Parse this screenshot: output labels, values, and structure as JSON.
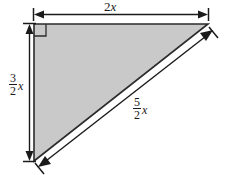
{
  "figure": {
    "type": "geometry-diagram",
    "shape": "right-triangle",
    "background_color": "#ffffff",
    "fill_color": "#c9c9c9",
    "stroke_color": "#2b2b2b",
    "right_angle_marker": {
      "present": true,
      "location": "top-left-vertex"
    },
    "vertices": {
      "top_left": [
        34,
        24
      ],
      "top_right": [
        208,
        24
      ],
      "bottom_left": [
        34,
        161
      ]
    },
    "labels": {
      "top": {
        "name": "top-side-length",
        "coefficient": "2",
        "variable": "x",
        "text": "2x"
      },
      "left": {
        "name": "left-side-length",
        "numerator": "3",
        "denominator": "2",
        "variable": "x",
        "text": "3/2 x"
      },
      "hypotenuse": {
        "name": "hypotenuse-length",
        "numerator": "5",
        "denominator": "2",
        "variable": "x",
        "text": "5/2 x"
      }
    },
    "dimension_lines": [
      {
        "name": "top-dimension-line",
        "orientation": "horizontal",
        "arrowheads": "both",
        "end_ticks": true
      },
      {
        "name": "left-dimension-line",
        "orientation": "vertical",
        "arrowheads": "both",
        "end_ticks": true
      },
      {
        "name": "hypotenuse-dimension-line",
        "orientation": "diagonal",
        "arrowheads": "both",
        "end_ticks": true
      }
    ]
  }
}
